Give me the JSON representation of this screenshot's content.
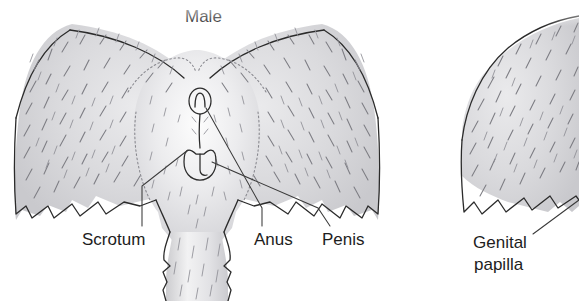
{
  "figure": {
    "title_male": "Male",
    "background_color": "#ffffff",
    "ink_color": "#2b2b2b",
    "fur_color": "#d6d6d8",
    "hair_stroke_color": "#7d7d83",
    "text_color": "#1d1d1d"
  },
  "panels": {
    "left": {
      "name": "male-perineum",
      "title": "Male",
      "labels": {
        "scrotum": "Scrotum",
        "anus": "Anus",
        "penis": "Penis"
      }
    },
    "right": {
      "name": "female-perineum",
      "labels": {
        "genital_papilla_line1": "Genital",
        "genital_papilla_line2": "papilla"
      }
    }
  }
}
